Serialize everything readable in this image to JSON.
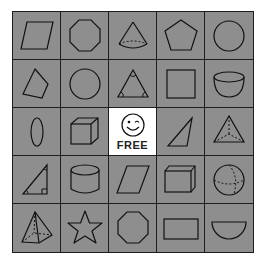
{
  "board": {
    "colors": {
      "cell": "#8e8e8e",
      "line": "#1e1e1e",
      "free": "#ffffff"
    },
    "rows": [
      [
        "parallelogram",
        "octagon",
        "cone",
        "pentagon",
        "circle"
      ],
      [
        "quadrilateral",
        "circle",
        "triangle-with-angles",
        "square",
        "hemisphere-bowl"
      ],
      [
        "oval",
        "cube",
        "free",
        "right-triangle-thin",
        "triangular-pyramid"
      ],
      [
        "right-triangle",
        "cylinder",
        "parallelogram",
        "rectangular-prism",
        "sphere"
      ],
      [
        "square-pyramid",
        "star",
        "octagon",
        "rectangle",
        "semicircle"
      ]
    ],
    "free_cell": {
      "icon": "winking-smiley-icon",
      "label": "FREE"
    }
  }
}
